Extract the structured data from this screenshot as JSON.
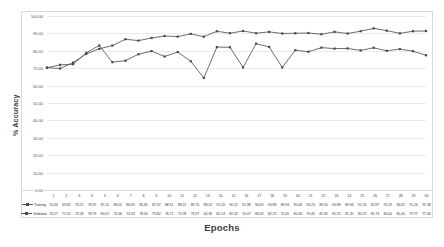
{
  "chart_data": {
    "type": "line",
    "title": "",
    "xlabel": "Epochs",
    "ylabel": "% Accuracy",
    "xlim": [
      1,
      30
    ],
    "ylim": [
      0,
      100
    ],
    "grid": true,
    "legend_position": "bottom-table",
    "categories": [
      "1",
      "2",
      "3",
      "4",
      "5",
      "6",
      "7",
      "8",
      "9",
      "10",
      "11",
      "12",
      "13",
      "14",
      "15",
      "16",
      "17",
      "18",
      "19",
      "20",
      "21",
      "22",
      "23",
      "24",
      "25",
      "26",
      "27",
      "28",
      "29",
      "30"
    ],
    "y_ticks": [
      "0.00",
      "10.00",
      "20.00",
      "30.00",
      "40.00",
      "50.00",
      "60.00",
      "70.00",
      "80.00",
      "90.00",
      "100.00"
    ],
    "series": [
      {
        "name": "Training",
        "values": [
          70.33,
          69.82,
          73.22,
          78.19,
          81.11,
          83.01,
          86.65,
          85.85,
          87.37,
          88.51,
          88.15,
          89.7,
          88.13,
          91.2,
          90.12,
          91.38,
          90.09,
          90.88,
          89.94,
          90.08,
          90.23,
          89.5,
          90.88,
          89.94,
          91.26,
          92.87,
          91.59,
          90.02,
          91.26,
          91.38
        ]
      },
      {
        "name": "Validation",
        "values": [
          70.27,
          71.92,
          72.28,
          78.79,
          83.07,
          73.46,
          74.32,
          78.05,
          79.82,
          76.71,
          79.28,
          73.97,
          64.39,
          82.14,
          82.02,
          70.47,
          84.09,
          82.23,
          70.45,
          80.34,
          79.45,
          81.82,
          81.25,
          81.35,
          80.23,
          81.73,
          80.0,
          81.0,
          79.77,
          77.44
        ]
      }
    ]
  },
  "axis_titles": {
    "x": "Epochs",
    "y": "% Accuracy"
  }
}
